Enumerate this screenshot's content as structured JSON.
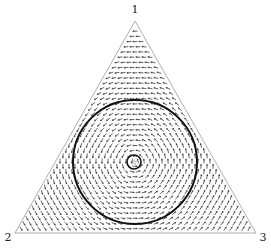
{
  "diagram": {
    "type": "simplex-vector-field",
    "vertices": [
      {
        "label": "1",
        "x": 135,
        "y": 21,
        "label_x": 135,
        "label_y": 13
      },
      {
        "label": "2",
        "x": 15,
        "y": 233,
        "label_x": 8,
        "label_y": 241
      },
      {
        "label": "3",
        "x": 256,
        "y": 233,
        "label_x": 263,
        "label_y": 241
      }
    ],
    "large_circle": {
      "cx": 135,
      "cy": 162,
      "r": 62
    },
    "small_circle": {
      "cx": 134,
      "cy": 162,
      "r": 7
    },
    "center_marker": "star",
    "colors": {
      "arrows": "#555555",
      "edges": "#999999",
      "circles": "#111111"
    },
    "grid_spacing": 6
  }
}
